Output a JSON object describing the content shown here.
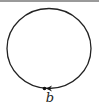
{
  "diagram": {
    "type": "closed-loop",
    "shape": "circle",
    "stroke_color": "#222222",
    "point_label": "b",
    "arrow_direction": "left (counter-clockwise along bottom)"
  }
}
